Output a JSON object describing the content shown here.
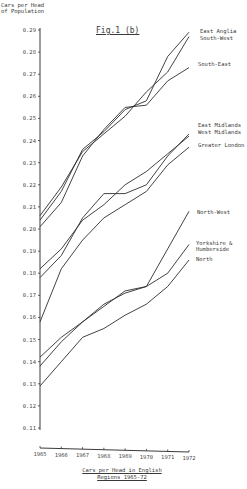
{
  "chart_data": {
    "type": "line",
    "title": "Fig.1 (b)",
    "ylabel": "Cars per Head of Population",
    "xlabel": "Cars per Head in English Regions 1965-72",
    "x": [
      1965,
      1966,
      1967,
      1968,
      1969,
      1970,
      1971,
      1972
    ],
    "yticks": [
      0.29,
      0.28,
      0.27,
      0.26,
      0.25,
      0.24,
      0.23,
      0.22,
      0.21,
      0.2,
      0.19,
      0.18,
      0.17,
      0.16,
      0.15,
      0.14,
      0.13,
      0.12,
      0.11
    ],
    "ylim": [
      0.11,
      0.29
    ],
    "grid": false,
    "legend_position": "inline-right",
    "series": [
      {
        "name": "East Anglia",
        "values": [
          0.204,
          0.217,
          0.236,
          0.244,
          0.254,
          0.258,
          0.278,
          0.289
        ]
      },
      {
        "name": "South-West",
        "values": [
          0.206,
          0.219,
          0.235,
          0.243,
          0.251,
          0.262,
          0.271,
          0.287
        ]
      },
      {
        "name": "South-East",
        "values": [
          0.201,
          0.212,
          0.233,
          0.245,
          0.255,
          0.256,
          0.267,
          0.273
        ]
      },
      {
        "name": "East Midlands",
        "values": [
          0.178,
          0.188,
          0.205,
          0.216,
          0.216,
          0.22,
          0.233,
          0.243
        ]
      },
      {
        "name": "West Midlands",
        "values": [
          0.182,
          0.191,
          0.204,
          0.211,
          0.22,
          0.226,
          0.234,
          0.242
        ]
      },
      {
        "name": "Greater London",
        "values": [
          0.158,
          0.182,
          0.195,
          0.205,
          0.211,
          0.217,
          0.229,
          0.237
        ]
      },
      {
        "name": "North-West",
        "values": [
          0.142,
          0.151,
          0.158,
          0.165,
          0.172,
          0.174,
          0.191,
          0.208
        ]
      },
      {
        "name": "Yorkshire & Humberside",
        "values": [
          0.138,
          0.149,
          0.158,
          0.166,
          0.171,
          0.174,
          0.18,
          0.193
        ]
      },
      {
        "name": "North",
        "values": [
          0.129,
          0.14,
          0.151,
          0.155,
          0.161,
          0.166,
          0.174,
          0.186
        ]
      }
    ]
  },
  "labels": {
    "ylabel_line1": "Cars per Head",
    "ylabel_line2": "of Population",
    "title": "Fig.1 (b)",
    "caption_line1": "Cars per Head in English",
    "caption_line2": "Regions 1965-72"
  },
  "series_label_positions": [
    {
      "text": "East Anglia",
      "x": 200,
      "y": 33
    },
    {
      "text": "South-West",
      "x": 200,
      "y": 40
    },
    {
      "text": "South-East",
      "x": 198,
      "y": 66
    },
    {
      "text": "East Midlands",
      "x": 198,
      "y": 127
    },
    {
      "text": "West Midlands",
      "x": 198,
      "y": 134
    },
    {
      "text": "Greater London",
      "x": 198,
      "y": 147
    },
    {
      "text": "North-West",
      "x": 197,
      "y": 214
    },
    {
      "text": "Yorkshire &",
      "x": 196,
      "y": 245
    },
    {
      "text": "Humberside",
      "x": 196,
      "y": 251
    },
    {
      "text": "North",
      "x": 196,
      "y": 261
    }
  ],
  "colors": {
    "line": "#2e2e2e",
    "axis": "#3a3a3a",
    "background": "#ffffff"
  }
}
